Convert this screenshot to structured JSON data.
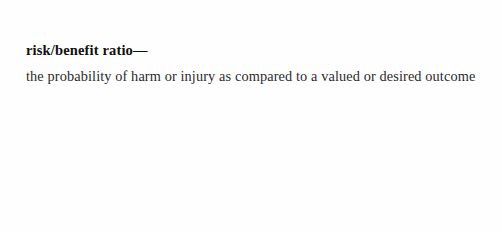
{
  "page": {
    "background_color": "#ffffff",
    "text_color": "#1a1a1a"
  },
  "entry": {
    "headword": "risk/benefit ratio—",
    "definition": "the probability of harm or injury as compared to a valued or desired outcome"
  }
}
